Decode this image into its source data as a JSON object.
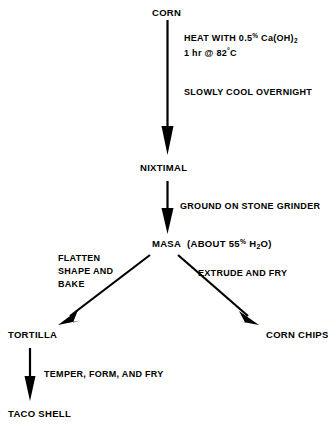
{
  "diagram": {
    "background_color": "#ffffff",
    "ink_color": "#000000",
    "nodes": [
      {
        "id": "corn",
        "label": "CORN"
      },
      {
        "id": "nixtimal",
        "label": "NIXTIMAL"
      },
      {
        "id": "masa",
        "label": "MASA  (ABOUT 55% H2O)"
      },
      {
        "id": "tortilla",
        "label": "TORTILLA"
      },
      {
        "id": "corn_chips",
        "label": "CORN CHIPS"
      },
      {
        "id": "taco_shell",
        "label": "TACO SHELL"
      }
    ],
    "masa_parts": {
      "name": "MASA",
      "paren_open": "(ABOUT 55",
      "percent": "%",
      "water_h": " H",
      "water_sub": "2",
      "water_o": "O)"
    },
    "edges": [
      {
        "id": "corn-to-nixtimal",
        "from": "CORN",
        "to": "NIXTIMAL",
        "labels": [
          "HEAT WITH 0.5% Ca(OH)2  1 hr @ 82°C",
          "SLOWLY COOL OVERNIGHT"
        ]
      },
      {
        "id": "nixtimal-to-masa",
        "from": "NIXTIMAL",
        "to": "MASA",
        "labels": [
          "GROUND ON STONE GRINDER"
        ]
      },
      {
        "id": "masa-to-tortilla",
        "from": "MASA",
        "to": "TORTILLA",
        "labels": [
          "FLATTEN SHAPE AND BAKE"
        ]
      },
      {
        "id": "masa-to-corn-chips",
        "from": "MASA",
        "to": "CORN CHIPS",
        "labels": [
          "EXTRUDE AND FRY"
        ]
      },
      {
        "id": "tortilla-to-taco-shell",
        "from": "TORTILLA",
        "to": "TACO SHELL",
        "labels": [
          "TEMPER, FORM, AND FRY"
        ]
      }
    ],
    "edge_labels": {
      "heat_line1_a": "HEAT WITH 0.5",
      "heat_line1_pct": "%",
      "heat_line1_b": " Ca(OH)",
      "heat_line1_sub": "2",
      "heat_line2_a": "1 hr @ 82",
      "heat_line2_deg": "°",
      "heat_line2_b": "C",
      "slowly_cool": "SLOWLY COOL OVERNIGHT",
      "ground_on_stone_grinder": "GROUND ON STONE GRINDER",
      "flatten_shape_bake": "FLATTEN\nSHAPE AND\nBAKE",
      "extrude_and_fry": "EXTRUDE AND FRY",
      "temper_form_fry": "TEMPER, FORM, AND FRY"
    }
  }
}
